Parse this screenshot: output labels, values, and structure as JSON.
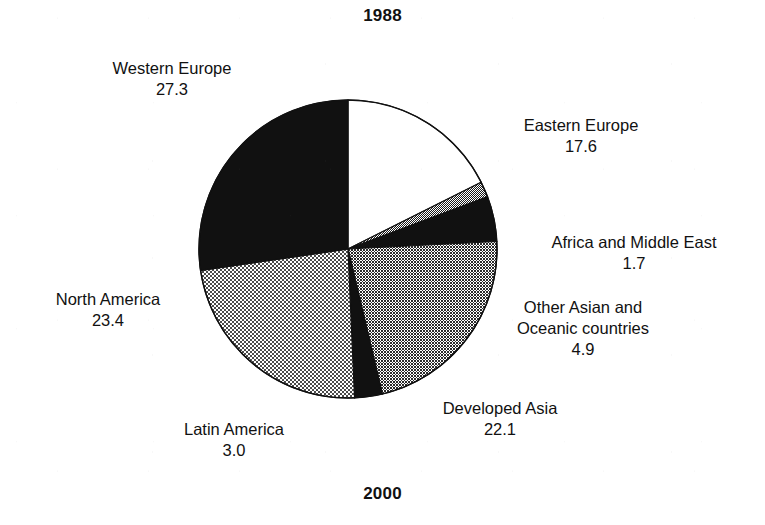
{
  "titles": {
    "top": "1988",
    "bottom": "2000"
  },
  "colors": {
    "ink": "#111111",
    "paper": "#ffffff",
    "solid_black": "#111111",
    "light_checker": "#c9c9c9",
    "medium_checker": "#8f8f8f",
    "fine_dot": "#555555",
    "white_fill": "#ffffff"
  },
  "labels": {
    "western_europe": {
      "category": "Western Europe",
      "value": "27.3"
    },
    "north_america": {
      "category": "North America",
      "value": "23.4"
    },
    "latin_america": {
      "category": "Latin America",
      "value": "3.0"
    },
    "developed_asia": {
      "category": "Developed Asia",
      "value": "22.1"
    },
    "other_asian": {
      "category_line1": "Other Asian and",
      "category_line2": "Oceanic countries",
      "value": "4.9"
    },
    "africa_me": {
      "category": "Africa and Middle East",
      "value": "1.7"
    },
    "eastern_europe": {
      "category": "Eastern Europe",
      "value": "17.6"
    }
  },
  "chart_data": {
    "type": "pie",
    "title": "1988",
    "subtitle": "2000",
    "xlabel": "",
    "ylabel": "",
    "total": 100.0,
    "units": "percent",
    "start_angle_deg": 0,
    "direction": "clockwise",
    "legend": "none (direct labels with leader-free callouts)",
    "grid": false,
    "categories": [
      "Eastern Europe",
      "Africa and Middle East",
      "Other Asian and Oceanic countries",
      "Developed Asia",
      "Latin America",
      "North America",
      "Western Europe"
    ],
    "values": [
      17.6,
      1.7,
      4.9,
      22.1,
      3.0,
      23.4,
      27.3
    ],
    "slices": [
      {
        "label": "Eastern Europe",
        "value": 17.6,
        "fill": "white",
        "fill_color": "#ffffff",
        "start_deg": 0.0,
        "end_deg": 63.36
      },
      {
        "label": "Africa and Middle East",
        "value": 1.7,
        "fill": "fine-dot",
        "fill_color": "#555555",
        "start_deg": 63.36,
        "end_deg": 69.48
      },
      {
        "label": "Other Asian and Oceanic countries",
        "value": 4.9,
        "fill": "solid-black",
        "fill_color": "#111111",
        "start_deg": 69.48,
        "end_deg": 87.12
      },
      {
        "label": "Developed Asia",
        "value": 22.1,
        "fill": "medium-checker",
        "fill_color": "#8f8f8f",
        "start_deg": 87.12,
        "end_deg": 166.68
      },
      {
        "label": "Latin America",
        "value": 3.0,
        "fill": "solid-black",
        "fill_color": "#111111",
        "start_deg": 166.68,
        "end_deg": 177.48
      },
      {
        "label": "North America",
        "value": 23.4,
        "fill": "light-checker",
        "fill_color": "#c9c9c9",
        "start_deg": 177.48,
        "end_deg": 261.72
      },
      {
        "label": "Western Europe",
        "value": 27.3,
        "fill": "solid-black",
        "fill_color": "#111111",
        "start_deg": 261.72,
        "end_deg": 360.0
      }
    ]
  }
}
